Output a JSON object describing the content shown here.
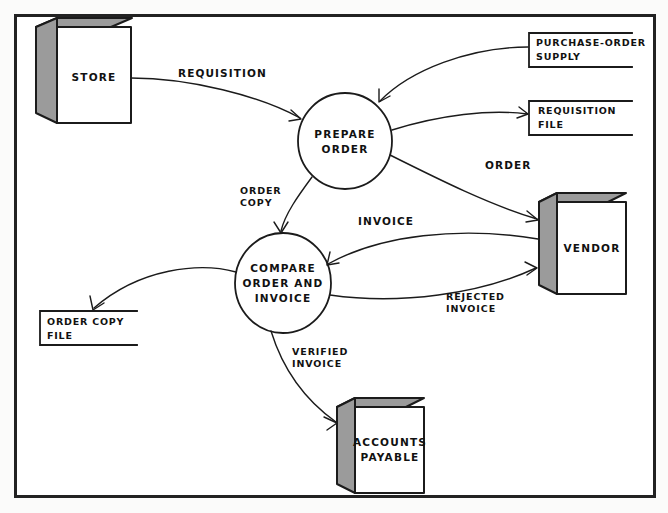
{
  "diagram": {
    "frame": {
      "border_color": "#222222",
      "background": "#ffffff"
    },
    "external_entities": [
      {
        "id": "store",
        "label": "STORE",
        "shape": "cube"
      },
      {
        "id": "vendor",
        "label": "VENDOR",
        "shape": "cube"
      },
      {
        "id": "accounts_payable",
        "label_line1": "ACCOUNTS",
        "label_line2": "PAYABLE",
        "shape": "cube"
      }
    ],
    "processes": [
      {
        "id": "prepare_order",
        "label_line1": "PREPARE",
        "label_line2": "ORDER",
        "shape": "circle"
      },
      {
        "id": "compare",
        "label_line1": "COMPARE",
        "label_line2": "ORDER AND",
        "label_line3": "INVOICE",
        "shape": "circle"
      }
    ],
    "data_stores": [
      {
        "id": "purchase_order_supply",
        "label_line1": "PURCHASE-ORDER",
        "label_line2": "SUPPLY"
      },
      {
        "id": "requisition_file",
        "label_line1": "REQUISITION",
        "label_line2": "FILE"
      },
      {
        "id": "order_copy_file",
        "label_line1": "ORDER COPY",
        "label_line2": "FILE"
      }
    ],
    "flows": [
      {
        "id": "requisition",
        "label": "REQUISITION",
        "from": "store",
        "to": "prepare_order"
      },
      {
        "id": "purchase_order_supply_flow",
        "label": "",
        "from": "purchase_order_supply",
        "to": "prepare_order"
      },
      {
        "id": "requisition_file_flow",
        "label": "",
        "from": "prepare_order",
        "to": "requisition_file"
      },
      {
        "id": "order",
        "label": "ORDER",
        "from": "prepare_order",
        "to": "vendor"
      },
      {
        "id": "order_copy",
        "label_line1": "ORDER",
        "label_line2": "COPY",
        "from": "prepare_order",
        "to": "compare"
      },
      {
        "id": "invoice",
        "label": "INVOICE",
        "from": "vendor",
        "to": "compare"
      },
      {
        "id": "rejected_invoice",
        "label_line1": "REJECTED",
        "label_line2": "INVOICE",
        "from": "compare",
        "to": "vendor"
      },
      {
        "id": "order_copy_file_flow",
        "label": "",
        "from": "compare",
        "to": "order_copy_file"
      },
      {
        "id": "verified_invoice",
        "label_line1": "VERIFIED",
        "label_line2": "INVOICE",
        "from": "compare",
        "to": "accounts_payable"
      }
    ]
  }
}
